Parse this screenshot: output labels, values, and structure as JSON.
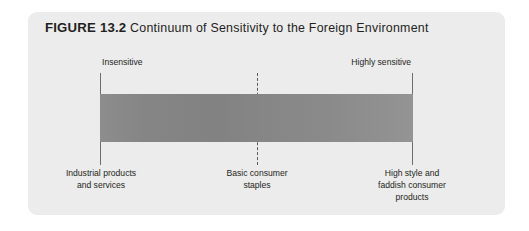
{
  "figure": {
    "number_label": "FIGURE 13.2",
    "caption": "Continuum of Sensitivity to the Foreign Environment"
  },
  "chart_data": {
    "type": "bar",
    "title": "FIGURE 13.2 Continuum of Sensitivity to the Foreign Environment",
    "orientation": "horizontal",
    "axis": {
      "left_endpoint_label": "Insensitive",
      "right_endpoint_label": "Highly sensitive",
      "range": [
        0,
        100
      ],
      "grid": false,
      "legend": "none"
    },
    "markers": [
      {
        "position": 0,
        "style": "solid",
        "top_label": "Insensitive",
        "bottom_label": "Industrial products and services",
        "bottom_label_lines": [
          "Industrial products",
          "and services"
        ]
      },
      {
        "position": 50,
        "style": "dashed",
        "top_label": "",
        "bottom_label": "Basic consumer staples",
        "bottom_label_lines": [
          "Basic consumer",
          "staples"
        ]
      },
      {
        "position": 100,
        "style": "solid",
        "top_label": "Highly sensitive",
        "bottom_label": "High style and faddish consumer products",
        "bottom_label_lines": [
          "High style and",
          "faddish consumer",
          "products"
        ]
      }
    ],
    "colors": {
      "bar_start": "#8d8d8d",
      "bar_end": "#949494",
      "card_background": "#ececec",
      "page_background": "#ffffff",
      "text": "#231f20",
      "rule": "#6e6e6e"
    }
  },
  "labels": {
    "top_left": "Insensitive",
    "top_right": "Highly sensitive",
    "bottom_left_line1": "Industrial products",
    "bottom_left_line2": "and services",
    "bottom_middle_line1": "Basic consumer",
    "bottom_middle_line2": "staples",
    "bottom_right_line1": "High style and",
    "bottom_right_line2": "faddish consumer",
    "bottom_right_line3": "products"
  }
}
